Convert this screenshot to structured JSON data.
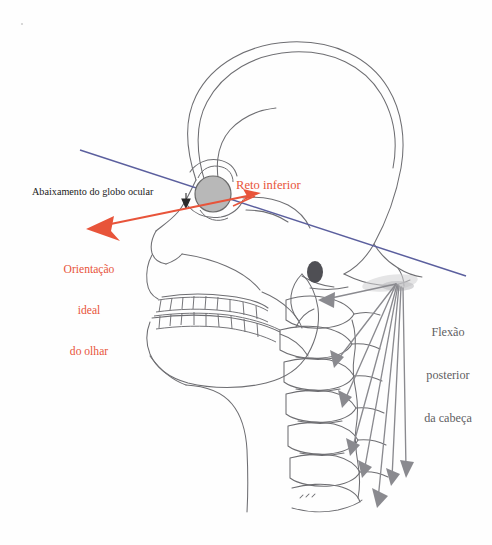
{
  "figure": {
    "type": "anatomical-diagram",
    "language": "pt-BR",
    "background_color": "#fefefe"
  },
  "labels": {
    "eyeball_depression": "Abaixamento do globo ocular",
    "inferior_rectus": "Reto inferior",
    "ideal_gaze": "Orientação\nideal\ndo olhar",
    "ideal_gaze_lines": [
      "Orientação",
      "ideal",
      "do olhar"
    ],
    "posterior_flexion": "Flexão\nposterior\nda cabeça",
    "posterior_flexion_lines": [
      "Flexão",
      "posterior",
      "da cabeça"
    ]
  },
  "colors": {
    "red_accent": "#e8543a",
    "blue_reference_line": "#5b5f9e",
    "bone_outline": "#6e6e72",
    "gray_arrow": "#8a8a8f",
    "eyeball_fill": "#b8b8b8",
    "eyeball_stroke": "#6a6a6a",
    "mastoid_fill": "#4f4f54",
    "text_black": "#1a1a1a",
    "text_gray": "#5f5f63"
  },
  "elements": {
    "eyeball": {
      "name": "globo-ocular",
      "cx": 213,
      "cy": 194,
      "r": 18
    },
    "mastoid": {
      "name": "processo-mastoide",
      "cx": 315,
      "cy": 272,
      "rx": 8,
      "ry": 11
    },
    "blue_line": {
      "name": "linha-de-referencia",
      "x1": 80,
      "y1": 150,
      "x2": 466,
      "y2": 276
    },
    "red_arrow": {
      "name": "eixo-visual-reto-inferior",
      "x1": 88,
      "y1": 229,
      "x2": 258,
      "y2": 194
    },
    "arrow_fan_origin": {
      "x": 396,
      "y": 284,
      "count": 7
    },
    "vertebrae_count": 7
  }
}
